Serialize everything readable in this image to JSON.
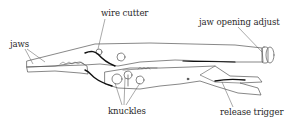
{
  "diagram": {
    "labels": [
      {
        "id": "wire_cutter",
        "text": "wire cutter"
      },
      {
        "id": "jaw_opening_adjust",
        "text": "jaw opening adjust"
      },
      {
        "id": "jaws",
        "text": "jaws"
      },
      {
        "id": "knuckles",
        "text": "knuckles"
      },
      {
        "id": "release_trigger",
        "text": "release trigger"
      }
    ],
    "colors": {
      "line": "#444444",
      "dark": "#111111",
      "text": "#2a2a2a",
      "background": "#ffffff"
    }
  }
}
